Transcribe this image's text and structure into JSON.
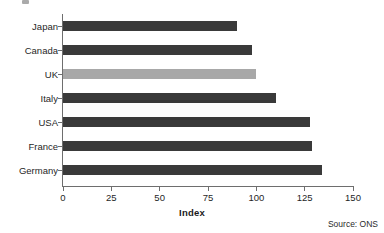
{
  "chart_data": {
    "type": "bar",
    "orientation": "horizontal",
    "title": "",
    "xlabel": "Index",
    "ylabel": "",
    "categories": [
      "Japan",
      "Canada",
      "UK",
      "Italy",
      "USA",
      "France",
      "Germany"
    ],
    "values": [
      90,
      98,
      100,
      110,
      128,
      129,
      134
    ],
    "xlim": [
      0,
      150
    ],
    "xticks": [
      0,
      25,
      50,
      75,
      100,
      125,
      150
    ],
    "xtick_labels": [
      "0",
      "25",
      "50",
      "75",
      "100",
      "125",
      "150"
    ],
    "grid": false,
    "legend": null,
    "bar_colors": [
      "#3a3a3a",
      "#3a3a3a",
      "#a8a8a8",
      "#3a3a3a",
      "#3a3a3a",
      "#3a3a3a",
      "#3a3a3a"
    ],
    "highlight_category": "UK",
    "annotations": [
      "Source: ONS"
    ]
  },
  "figure": {
    "axis_title": "Index",
    "source_note": "Source: ONS",
    "colors": {
      "bar_default": "#3a3a3a",
      "bar_highlight": "#a8a8a8",
      "axis": "#6e6e6e",
      "text": "#1f1f1f",
      "background": "#ffffff"
    }
  }
}
